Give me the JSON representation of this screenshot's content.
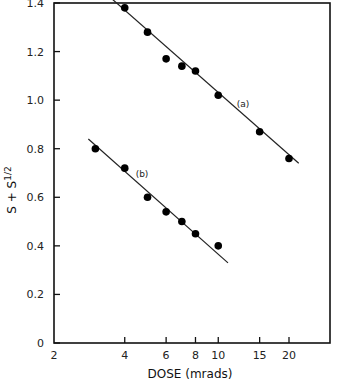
{
  "chart_data": {
    "type": "scatter",
    "title": "",
    "xlabel": "DOSE (mrads)",
    "ylabel": "S + S^1/2",
    "xscale": "log",
    "xlim": [
      2,
      30
    ],
    "ylim": [
      0,
      1.4
    ],
    "xticks": [
      2,
      4,
      6,
      8,
      10,
      15,
      20
    ],
    "xtick_labels": [
      "2",
      "4",
      "6",
      "8",
      "10",
      "15",
      "20"
    ],
    "yticks": [
      0,
      0.2,
      0.4,
      0.6,
      0.8,
      1.0,
      1.2,
      1.4
    ],
    "ytick_labels": [
      "0",
      "0.2",
      "0.4",
      "0.6",
      "0.8",
      "1.0",
      "1.2",
      "1.4"
    ],
    "grid": false,
    "series": [
      {
        "name": "(a)",
        "x": [
          4,
          5,
          6,
          7,
          8,
          10,
          15,
          20
        ],
        "y": [
          1.38,
          1.28,
          1.17,
          1.14,
          1.12,
          1.02,
          0.87,
          0.76
        ],
        "fit_line": {
          "x": [
            3.5,
            22
          ],
          "y": [
            1.42,
            0.74
          ]
        }
      },
      {
        "name": "(b)",
        "x": [
          3,
          4,
          5,
          6,
          7,
          8,
          10
        ],
        "y": [
          0.8,
          0.72,
          0.6,
          0.54,
          0.5,
          0.45,
          0.4
        ],
        "fit_line": {
          "x": [
            2.8,
            11
          ],
          "y": [
            0.84,
            0.33
          ]
        }
      }
    ]
  }
}
